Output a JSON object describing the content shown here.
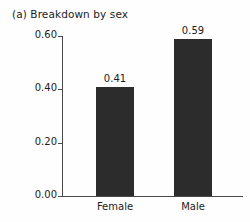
{
  "chart_data": {
    "type": "bar",
    "title": "(a) Breakdown by sex",
    "xlabel": "",
    "ylabel": "Relative frequency",
    "categories": [
      "Female",
      "Male"
    ],
    "values": [
      0.41,
      0.59
    ],
    "value_labels": [
      "0.41",
      "0.59"
    ],
    "ylim": [
      0.0,
      0.6
    ],
    "yticks": [
      0.0,
      0.2,
      0.4,
      0.6
    ],
    "ytick_labels": [
      "0.00",
      "0.20",
      "0.40",
      "0.60"
    ],
    "grid": false,
    "legend": null,
    "bar_color": "#2c2c2c",
    "axis_color": "#4a4a4a",
    "background_color": "#fefefe"
  }
}
